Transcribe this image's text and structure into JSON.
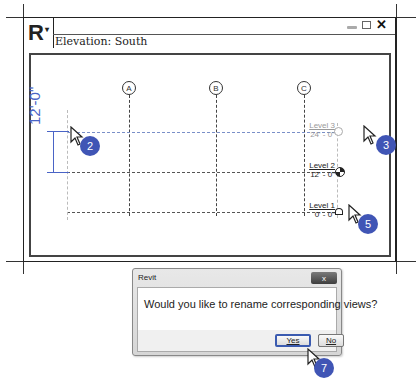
{
  "app": {
    "logo": "R",
    "logo_caret": "▾",
    "view_title": "Elevation: South",
    "controls": {
      "minimize": "minimize",
      "maximize": "maximize",
      "close": "✕"
    }
  },
  "grids": [
    {
      "label": "A"
    },
    {
      "label": "B"
    },
    {
      "label": "C"
    }
  ],
  "levels": [
    {
      "name": "Level 3",
      "elevation": "24' - 0\"",
      "state": "selected"
    },
    {
      "name": "Level 2",
      "elevation": "12' - 0\"",
      "state": "normal"
    },
    {
      "name": "Level 1",
      "elevation": "0' - 0\"",
      "state": "normal"
    }
  ],
  "dimension": {
    "text": "12'-0\"",
    "color": "#4a64c6"
  },
  "steps": [
    {
      "number": "2"
    },
    {
      "number": "3"
    },
    {
      "number": "5"
    },
    {
      "number": "7"
    }
  ],
  "dialog": {
    "title": "Revit",
    "close_label": "x",
    "message": "Would you like to rename corresponding views?",
    "yes_label": "Yes",
    "no_label": "No"
  },
  "colors": {
    "step_badge": "#4055b5",
    "dimension": "#4a64c6"
  }
}
